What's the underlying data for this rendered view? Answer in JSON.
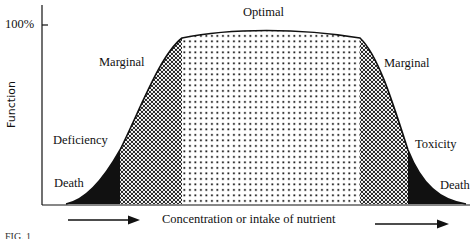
{
  "figure": {
    "y_axis_label": "Function",
    "y_tick_label": "100%",
    "x_axis_label": "Concentration or intake of nutrient",
    "caption": "FIG. 1",
    "regions": [
      {
        "name": "death-left",
        "label": "Death",
        "fill": "solid-black"
      },
      {
        "name": "deficiency",
        "label": "Deficiency",
        "fill": "solid-black"
      },
      {
        "name": "marginal-left",
        "label": "Marginal",
        "fill": "crosshatch"
      },
      {
        "name": "optimal",
        "label": "Optimal",
        "fill": "dots"
      },
      {
        "name": "marginal-right",
        "label": "Marginal",
        "fill": "crosshatch"
      },
      {
        "name": "toxicity",
        "label": "Toxicity",
        "fill": "solid-black"
      },
      {
        "name": "death-right",
        "label": "Death",
        "fill": "solid-black"
      }
    ],
    "labels": {
      "optimal": "Optimal",
      "marginal_left": "Marginal",
      "marginal_right": "Marginal",
      "deficiency": "Deficiency",
      "toxicity": "Toxicity",
      "death_left": "Death",
      "death_right": "Death"
    },
    "colors": {
      "ink": "#111111",
      "paper": "#ffffff"
    }
  }
}
